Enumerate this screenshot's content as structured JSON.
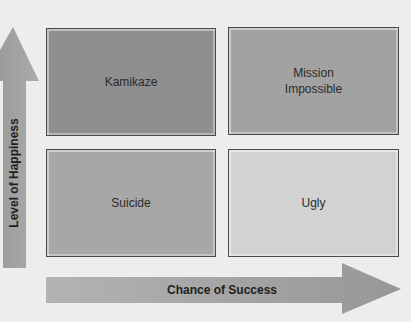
{
  "diagram": {
    "type": "2x2 matrix",
    "y_axis": {
      "label": "Level of Happiness",
      "direction": "up"
    },
    "x_axis": {
      "label": "Chance of Success",
      "direction": "right"
    },
    "quadrants": [
      {
        "position": "top-left",
        "label": "Kamikaze",
        "fill": "#8f8f8f"
      },
      {
        "position": "top-right",
        "label": "Mission\nImpossible",
        "fill": "#a2a2a2"
      },
      {
        "position": "bottom-left",
        "label": "Suicide",
        "fill": "#a7a7a7"
      },
      {
        "position": "bottom-right",
        "label": "Ugly",
        "fill": "#d2d2d2"
      }
    ]
  },
  "colors": {
    "background": "#ededec",
    "arrow_fill": "#a4a4a4",
    "border": "#4a4a4a"
  }
}
